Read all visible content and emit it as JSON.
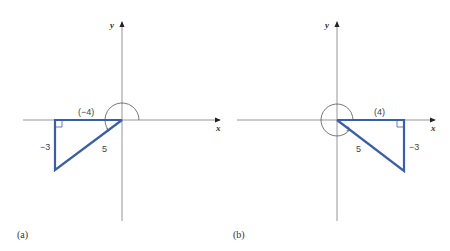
{
  "colors": {
    "triangle": "#3a5fa8",
    "axis": "#8a8a8a",
    "text": "#444444"
  },
  "panels": [
    {
      "caption": "(a)",
      "x_axis_label": "x",
      "y_axis_label": "y",
      "adjacent_label": "(−4)",
      "opposite_label": "−3",
      "hypotenuse_label": "5",
      "adjacent": -4,
      "opposite": -3,
      "hypotenuse": 5,
      "angle_arc": "positive rotation through quadrant II into quadrant III (~216.87°)"
    },
    {
      "caption": "(b)",
      "x_axis_label": "x",
      "y_axis_label": "y",
      "adjacent_label": "(4)",
      "opposite_label": "−3",
      "hypotenuse_label": "5",
      "adjacent": 4,
      "opposite": -3,
      "hypotenuse": 5,
      "angle_arc": "positive rotation nearly full circle into quadrant IV (~323.13°)"
    }
  ]
}
